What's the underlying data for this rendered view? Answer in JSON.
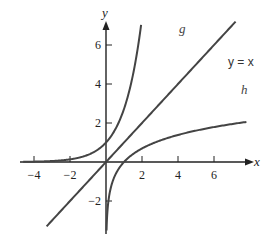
{
  "chart_data": {
    "type": "line",
    "title": "",
    "xlabel": "x",
    "ylabel": "y",
    "xlim": [
      -4.8,
      8
    ],
    "ylim": [
      -3.5,
      7.2
    ],
    "grid": false,
    "x_ticks": [
      -4,
      -2,
      2,
      4,
      6
    ],
    "x_tick_labels": [
      "−4",
      "−2",
      "2",
      "4",
      "6"
    ],
    "y_ticks": [
      -2,
      2,
      4,
      6
    ],
    "y_tick_labels": [
      "−2",
      "2",
      "4",
      "6"
    ],
    "series": [
      {
        "name": "g",
        "label": "g",
        "function": "e^x",
        "x_range": [
          -4.6,
          1.95
        ]
      },
      {
        "name": "y = x",
        "label": "y = x",
        "function": "x",
        "x_range": [
          -3.3,
          7.2
        ]
      },
      {
        "name": "h",
        "label": "h",
        "function": "ln(x)",
        "x_range": [
          0.03,
          7.8
        ]
      }
    ],
    "colors": {
      "curve": "#444444",
      "axis": "#222222"
    }
  }
}
